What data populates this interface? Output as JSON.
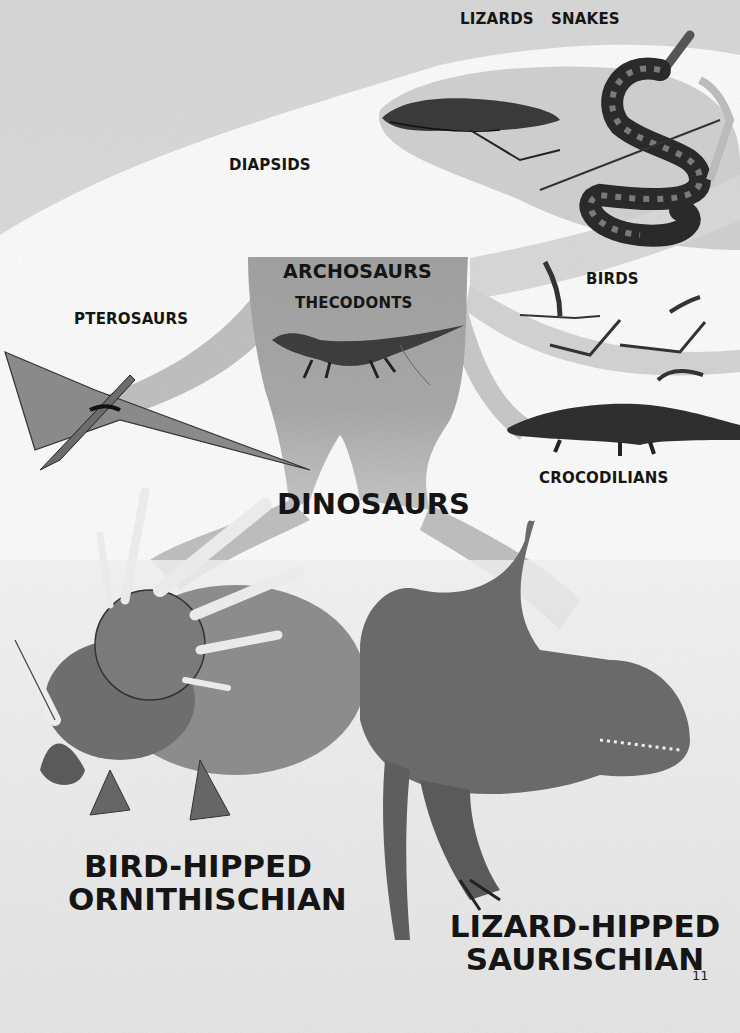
{
  "page": {
    "page_number": "11",
    "colors": {
      "background_top": "#d9d9d9",
      "background_white": "#fdfdfd",
      "branch_gray": "#a8a8a8",
      "trunk_gray": "#9a9a9a",
      "ground_speckle": "#e2e2e2",
      "ink": "#151515"
    }
  },
  "labels": {
    "lizards": "LIZARDS",
    "snakes": "SNAKES",
    "diapsids": "DIAPSIDS",
    "archosaurs": "ARCHOSAURS",
    "thecodonts": "THECODONTS",
    "birds": "BIRDS",
    "pterosaurs": "PTEROSAURS",
    "crocodilians": "CROCODILIANS",
    "dinosaurs": "DINOSAURS",
    "bird_hipped_line1": "BIRD-HIPPED",
    "bird_hipped_line2": "ORNITHISCHIAN",
    "lizard_hipped_line1": "LIZARD-HIPPED",
    "lizard_hipped_line2": "SAURISCHIAN"
  },
  "illustrations": [
    "lizard-illustration",
    "snake-illustration",
    "thecodont-illustration",
    "birds-illustration",
    "pterosaur-illustration",
    "crocodile-illustration",
    "styracosaurus-illustration",
    "allosaurus-illustration"
  ]
}
